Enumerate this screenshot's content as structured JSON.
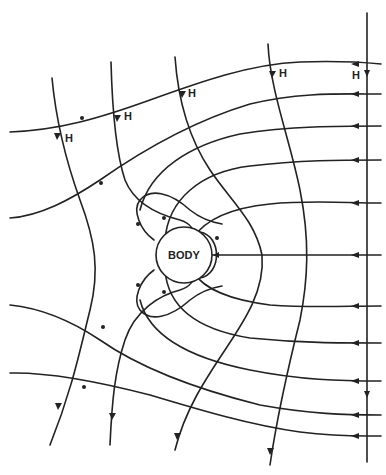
{
  "diagram": {
    "title": "",
    "body_label": "BODY",
    "h_labels": [
      {
        "text": "H",
        "x": 65,
        "y": 142
      },
      {
        "text": "H",
        "x": 124,
        "y": 120
      },
      {
        "text": "H",
        "x": 188,
        "y": 97
      },
      {
        "text": "H",
        "x": 279,
        "y": 77
      },
      {
        "text": "H",
        "x": 352,
        "y": 79
      }
    ],
    "colors": {
      "line": "#222222",
      "background": "#ffffff"
    }
  }
}
